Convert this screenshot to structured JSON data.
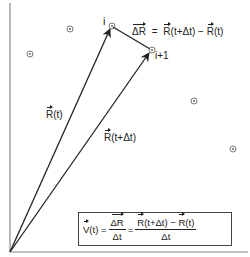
{
  "diagram": {
    "points": [
      {
        "label": "i",
        "x": 112,
        "y": 26
      },
      {
        "label": "i+1",
        "x": 152,
        "y": 50
      },
      {
        "label": "",
        "x": 70,
        "y": 29
      },
      {
        "label": "",
        "x": 30,
        "y": 54
      },
      {
        "label": "",
        "x": 194,
        "y": 101
      },
      {
        "label": "",
        "x": 233,
        "y": 149
      }
    ],
    "origin": {
      "x": 10,
      "y": 252
    },
    "vectors": [
      {
        "name": "R(t)",
        "label": "R(t)",
        "to": "i"
      },
      {
        "name": "R(t+Δt)",
        "label": "R(t+Δt)",
        "to": "i+1"
      },
      {
        "name": "ΔR",
        "label": "ΔR",
        "from": "i",
        "to": "i+1"
      }
    ],
    "labels": {
      "point_i": "i",
      "point_i1": "i+1",
      "r_t": "R",
      "r_t_arg": "(t)",
      "r_tdt": "R",
      "r_tdt_arg": "(t+Δt)",
      "delta_r": "ΔR",
      "delta_eq": "=",
      "delta_rhs_r1": "R",
      "delta_rhs_arg1": "(t+Δt) − ",
      "delta_rhs_r2": "R",
      "delta_rhs_arg2": "(t)"
    },
    "formula": {
      "v": "V",
      "v_arg": "(t) = ",
      "frac1_num": "ΔR",
      "frac1_den": "Δt",
      "eq2": " = ",
      "frac2_num_r1": "R",
      "frac2_num_arg1": "(t+Δt) − ",
      "frac2_num_r2": "R",
      "frac2_num_arg2": "(t)",
      "frac2_den": "Δt"
    },
    "colors": {
      "ink": "#222222",
      "axis": "#888888",
      "box": "#444444"
    }
  }
}
